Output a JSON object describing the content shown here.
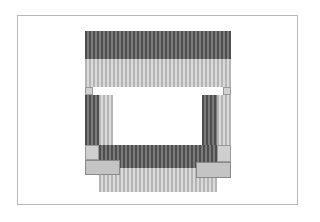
{
  "diagram": {
    "type": "cross-section block diagram",
    "colors": {
      "dark_stripe_a": "#4e4e4e",
      "dark_stripe_b": "#7a7a7a",
      "light_stripe_a": "#b4b4b4",
      "light_stripe_b": "#dadada",
      "solid_gray": "#c4c4c4",
      "frame": "#b8b8b8"
    },
    "blocks": [
      {
        "id": "top-dark-band",
        "x": 85,
        "y": 31,
        "w": 146,
        "h": 28,
        "fill": "dark"
      },
      {
        "id": "top-light-band",
        "x": 85,
        "y": 59,
        "w": 146,
        "h": 28,
        "fill": "light"
      },
      {
        "id": "top-left-spacer",
        "x": 85,
        "y": 87,
        "w": 8,
        "h": 8,
        "fill": "square"
      },
      {
        "id": "top-right-spacer",
        "x": 223,
        "y": 87,
        "w": 8,
        "h": 8,
        "fill": "square"
      },
      {
        "id": "left-dark-column",
        "x": 85,
        "y": 95,
        "w": 14,
        "h": 50,
        "fill": "dark"
      },
      {
        "id": "left-light-column",
        "x": 99,
        "y": 95,
        "w": 14,
        "h": 50,
        "fill": "light"
      },
      {
        "id": "right-dark-column",
        "x": 202,
        "y": 95,
        "w": 15,
        "h": 50,
        "fill": "dark"
      },
      {
        "id": "right-light-column",
        "x": 217,
        "y": 95,
        "w": 14,
        "h": 50,
        "fill": "light"
      },
      {
        "id": "bottom-left-square",
        "x": 85,
        "y": 145,
        "w": 14,
        "h": 15,
        "fill": "square"
      },
      {
        "id": "bottom-right-square",
        "x": 217,
        "y": 145,
        "w": 14,
        "h": 17,
        "fill": "square"
      },
      {
        "id": "bottom-dark-band",
        "x": 99,
        "y": 145,
        "w": 118,
        "h": 23,
        "fill": "dark"
      },
      {
        "id": "bottom-light-band",
        "x": 99,
        "y": 168,
        "w": 118,
        "h": 24,
        "fill": "light"
      },
      {
        "id": "bottom-left-block",
        "x": 85,
        "y": 160,
        "w": 35,
        "h": 15,
        "fill": "gray"
      },
      {
        "id": "bottom-right-block",
        "x": 196,
        "y": 162,
        "w": 35,
        "h": 16,
        "fill": "gray"
      }
    ]
  }
}
